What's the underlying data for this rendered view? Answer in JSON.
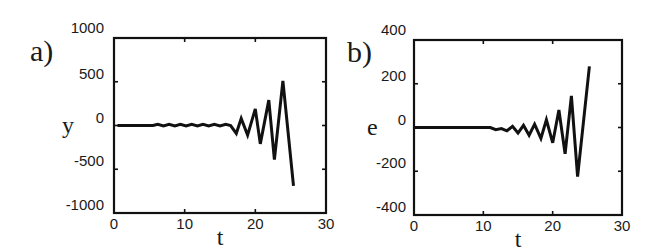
{
  "chart_data": [
    {
      "type": "line",
      "panel_label": "a)",
      "title": "",
      "xlabel": "t",
      "ylabel": "y",
      "xlim": [
        0,
        30
      ],
      "ylim": [
        -1000,
        1000
      ],
      "x_ticks": [
        "0",
        "10",
        "20",
        "30"
      ],
      "y_ticks": [
        "1000",
        "500",
        "0",
        "-500",
        "-1000"
      ],
      "grid": false,
      "legend": null,
      "series": [
        {
          "name": "y",
          "color": "#111111",
          "x": [
            0.5,
            5.5,
            6.2,
            7.0,
            7.8,
            8.6,
            9.4,
            10.2,
            11.0,
            11.8,
            12.6,
            13.4,
            14.2,
            15.0,
            15.8,
            16.5,
            17.3,
            18.0,
            18.9,
            20.0,
            20.7,
            21.9,
            22.7,
            23.9,
            25.4
          ],
          "values": [
            0,
            0,
            15,
            -5,
            15,
            -5,
            15,
            -5,
            15,
            -5,
            15,
            -5,
            15,
            -5,
            15,
            0,
            -90,
            80,
            -110,
            190,
            -210,
            290,
            -390,
            510,
            -690
          ]
        }
      ]
    },
    {
      "type": "line",
      "panel_label": "b)",
      "title": "",
      "xlabel": "t",
      "ylabel": "e",
      "xlim": [
        0,
        30
      ],
      "ylim": [
        -400,
        400
      ],
      "x_ticks": [
        "0",
        "10",
        "20",
        "30"
      ],
      "y_ticks": [
        "400",
        "200",
        "0",
        "-200",
        "-400"
      ],
      "grid": false,
      "legend": null,
      "series": [
        {
          "name": "e",
          "color": "#111111",
          "x": [
            0,
            11.0,
            11.8,
            12.6,
            13.4,
            14.2,
            15.0,
            15.8,
            16.6,
            17.4,
            18.3,
            19.1,
            20.0,
            20.9,
            21.8,
            22.7,
            23.6,
            25.3
          ],
          "values": [
            0,
            0,
            -10,
            -5,
            -15,
            5,
            -25,
            10,
            -35,
            15,
            -50,
            35,
            -70,
            80,
            -120,
            145,
            -225,
            280
          ]
        }
      ]
    }
  ],
  "panels": {
    "a": {
      "label": "a)",
      "ylabel": "y",
      "xlabel": "t"
    },
    "b": {
      "label": "b)",
      "ylabel": "e",
      "xlabel": "t"
    }
  }
}
